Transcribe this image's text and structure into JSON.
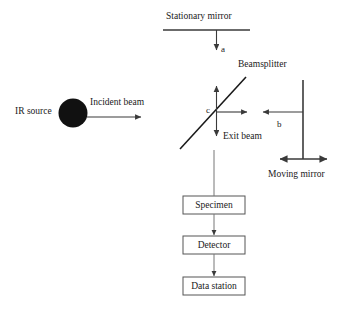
{
  "diagram": {
    "background_color": "#ffffff",
    "stroke_color": "#3a3a3a",
    "source_color": "#111111",
    "labels": {
      "stationary_mirror": "Stationary mirror",
      "beamsplitter": "Beamsplitter",
      "moving_mirror": "Moving mirror",
      "ir_source": "IR source",
      "incident_beam": "Incident beam",
      "exit_beam": "Exit beam",
      "path_a": "a",
      "path_b": "b",
      "path_c": "c"
    },
    "boxes": [
      {
        "id": "specimen",
        "label": "Specimen"
      },
      {
        "id": "detector",
        "label": "Detector"
      },
      {
        "id": "data_station",
        "label": "Data station"
      }
    ],
    "flow_order": [
      "Specimen",
      "Detector",
      "Data station"
    ]
  }
}
